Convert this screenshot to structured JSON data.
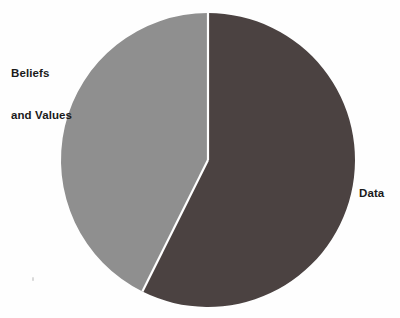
{
  "page": {
    "background_color": "#fefefe",
    "width": 400,
    "height": 318
  },
  "chart_data": {
    "type": "pie",
    "title": "",
    "subtitle": "",
    "xlabel": "",
    "ylabel": "",
    "legend_position": "none",
    "grid": false,
    "labels_position": "outside",
    "center": {
      "x": 208,
      "y": 160
    },
    "radius": 147,
    "start_angle_deg": 0,
    "direction": "clockwise",
    "separator_color": "#ffffff",
    "separator_width_px": 2,
    "categories": [
      "Data",
      "Beliefs and Values"
    ],
    "values": [
      57.4,
      42.6
    ],
    "units": "percent",
    "slices": [
      {
        "label": "Data",
        "label_line_1": "Data",
        "label_line_2": "",
        "value": 57.4,
        "angle_deg": 206.5,
        "start_angle_deg": 0,
        "end_angle_deg": 206.5,
        "color": "#4b4241",
        "label_side": "right"
      },
      {
        "label": "Beliefs and Values",
        "label_line_1": "Beliefs",
        "label_line_2": "and Values",
        "value": 42.6,
        "angle_deg": 153.5,
        "start_angle_deg": 206.5,
        "end_angle_deg": 360,
        "color": "#8f8f8f",
        "label_side": "left"
      }
    ],
    "colors": {
      "data_slice": "#4b4241",
      "beliefs_slice": "#8f8f8f",
      "label_text": "#1a1a1a",
      "background": "#fefefe"
    }
  },
  "labels": {
    "beliefs_line1": "Beliefs",
    "beliefs_line2": "and Values",
    "data": "Data"
  }
}
